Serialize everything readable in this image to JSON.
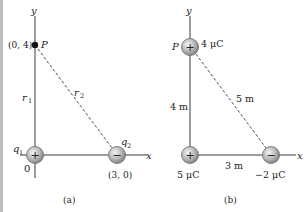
{
  "figure": {
    "panels": [
      {
        "id": "a",
        "caption": "(a)",
        "axis_x_label": "x",
        "axis_y_label": "y",
        "origin_label": "0",
        "point": {
          "label": "P",
          "coords": "(0, 4)"
        },
        "distances": {
          "r1": "r",
          "r1_sub": "1",
          "r2": "r",
          "r2_sub": "2"
        },
        "charges": [
          {
            "name": "q",
            "sub": "1",
            "sign": "+",
            "coords": ""
          },
          {
            "name": "q",
            "sub": "2",
            "sign": "−",
            "coords": "(3, 0)"
          }
        ]
      },
      {
        "id": "b",
        "caption": "(b)",
        "axis_x_label": "x",
        "axis_y_label": "y",
        "point": {
          "label": "P",
          "charge": "4 μC",
          "sign": "+"
        },
        "distances": {
          "vertical": "4 m",
          "horizontal": "3 m",
          "hypotenuse": "5 m"
        },
        "charges": [
          {
            "value": "5 μC",
            "sign": "+"
          },
          {
            "value": "−2 μC",
            "sign": "−"
          }
        ]
      }
    ],
    "colors": {
      "line": "#3a3a3a",
      "charge_fill_light": "#e8e8e8",
      "charge_fill_dark": "#8c8c8c",
      "border_strip": "#bdbdbd"
    }
  }
}
